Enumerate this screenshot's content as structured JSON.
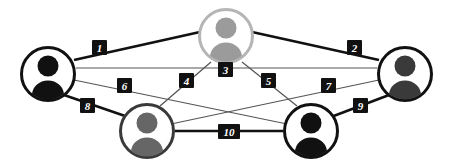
{
  "diagram": {
    "background_color": "#ffffff",
    "width": 453,
    "height": 165,
    "type": "node-link-graph"
  },
  "palette": {
    "black": "#111111",
    "dark_gray": "#3a3a3a",
    "mid_gray": "#666666",
    "light_gray": "#9b9b9b",
    "pale_gray": "#b5b5b5",
    "white": "#ffffff",
    "edge_thick": "#111111",
    "edge_thin": "#555555",
    "label_box": "#111111",
    "label_text": "#ffffff"
  },
  "nodes": [
    {
      "id": "top",
      "name": "person-top",
      "icon": "person-icon",
      "cx": 226,
      "cy": 36,
      "r": 28,
      "ring_color": "#b5b5b5",
      "ring_width": 3,
      "fill_color": "#ffffff",
      "figure_color": "#9b9b9b",
      "label": "Person A"
    },
    {
      "id": "left",
      "name": "person-left",
      "icon": "person-icon",
      "cx": 48,
      "cy": 74,
      "r": 28,
      "ring_color": "#111111",
      "ring_width": 3,
      "fill_color": "#ffffff",
      "figure_color": "#111111",
      "label": "Person B"
    },
    {
      "id": "right",
      "name": "person-right",
      "icon": "person-icon",
      "cx": 405,
      "cy": 74,
      "r": 28,
      "ring_color": "#111111",
      "ring_width": 3,
      "fill_color": "#ffffff",
      "figure_color": "#3a3a3a",
      "label": "Person C"
    },
    {
      "id": "bottomleft",
      "name": "person-bottom-left",
      "icon": "person-icon",
      "cx": 147,
      "cy": 131,
      "r": 28,
      "ring_color": "#3a3a3a",
      "ring_width": 3,
      "fill_color": "#ffffff",
      "figure_color": "#666666",
      "label": "Person D"
    },
    {
      "id": "bottomright",
      "name": "person-bottom-right",
      "icon": "person-icon",
      "cx": 311,
      "cy": 131,
      "r": 28,
      "ring_color": "#111111",
      "ring_width": 3,
      "fill_color": "#ffffff",
      "figure_color": "#111111",
      "label": "Person E"
    }
  ],
  "edges": [
    {
      "id": "e1",
      "label": "1",
      "from": "left",
      "to": "top",
      "weight": "thick",
      "lx": 99,
      "ly": 47
    },
    {
      "id": "e2",
      "label": "2",
      "from": "top",
      "to": "right",
      "weight": "thick",
      "lx": 354,
      "ly": 47
    },
    {
      "id": "e3",
      "label": "3",
      "from": "top",
      "to": "center",
      "weight": "thick",
      "lx": 226,
      "ly": 69
    },
    {
      "id": "e4",
      "label": "4",
      "from": "top",
      "to": "bottomleft",
      "weight": "thin",
      "lx": 187,
      "ly": 80
    },
    {
      "id": "e5",
      "label": "5",
      "from": "top",
      "to": "bottomright",
      "weight": "thin",
      "lx": 268,
      "ly": 80
    },
    {
      "id": "e6",
      "label": "6",
      "from": "left",
      "to": "bottomright",
      "weight": "thin",
      "lx": 125,
      "ly": 85
    },
    {
      "id": "e7",
      "label": "7",
      "from": "right",
      "to": "bottomleft",
      "weight": "thin",
      "lx": 328,
      "ly": 85
    },
    {
      "id": "e8",
      "label": "8",
      "from": "left",
      "to": "bottomleft",
      "weight": "thick",
      "lx": 87,
      "ly": 105
    },
    {
      "id": "e9",
      "label": "9",
      "from": "right",
      "to": "bottomright",
      "weight": "thick",
      "lx": 360,
      "ly": 105
    },
    {
      "id": "e10",
      "label": "10",
      "from": "bottomleft",
      "to": "bottomright",
      "weight": "thick",
      "lx": 229,
      "ly": 131
    }
  ],
  "edge_count": 10,
  "node_count": 5
}
